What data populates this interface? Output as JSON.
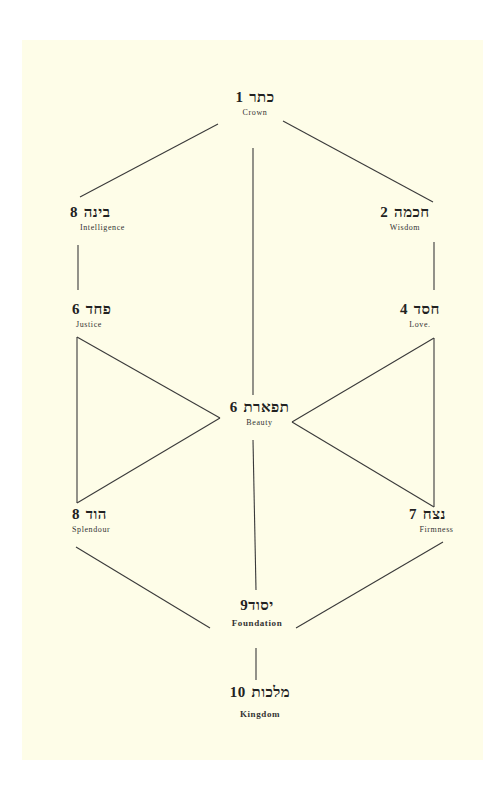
{
  "colors": {
    "paper": "#fefde8",
    "ink": "#222222",
    "background": "#ffffff"
  },
  "nodes": [
    {
      "id": "crown",
      "number": "1",
      "hebrew": "כתר",
      "english": "Crown"
    },
    {
      "id": "wisdom",
      "number": "2",
      "hebrew": "חכמה",
      "english": "Wisdom"
    },
    {
      "id": "intelligence",
      "number": "3",
      "hebrew": "בינה",
      "english": "Intelligence"
    },
    {
      "id": "love",
      "number": "4",
      "hebrew": "חסד",
      "english": "Love."
    },
    {
      "id": "justice",
      "number": "5",
      "hebrew": "פחד",
      "english": "Justice"
    },
    {
      "id": "beauty",
      "number": "6",
      "hebrew": "תפארת",
      "english": "Beauty"
    },
    {
      "id": "firmness",
      "number": "7",
      "hebrew": "נצח",
      "english": "Firmness"
    },
    {
      "id": "splendour",
      "number": "8",
      "hebrew": "הוד",
      "english": "Splendour"
    },
    {
      "id": "foundation",
      "number": "9",
      "hebrew": "יסוד",
      "english": "Foundation"
    },
    {
      "id": "kingdom",
      "number": "10",
      "hebrew": "מלכות",
      "english": "Kingdom"
    }
  ]
}
